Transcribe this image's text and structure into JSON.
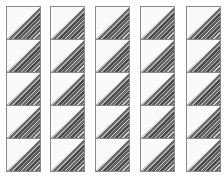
{
  "grid": {
    "columns": 5,
    "rows": 5,
    "column_x": [
      6,
      50,
      95,
      140,
      186
    ],
    "tile": "white upper-left triangle with diagonal gray stripes in lower-right triangle",
    "colors": {
      "border": "#8a8a8a",
      "background": "#fafafa",
      "stripe_dark": "#4a4a4a",
      "stripe_light": "#b4b4b4"
    }
  }
}
